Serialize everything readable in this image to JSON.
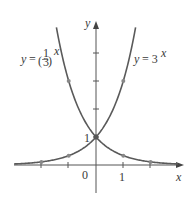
{
  "chart_data": {
    "type": "line",
    "title": "",
    "xlabel": "x",
    "ylabel": "y",
    "x_ticks": [
      "0",
      "1"
    ],
    "y_ticks": [
      "1"
    ],
    "xlim": [
      -3,
      2.9
    ],
    "ylim": [
      -0.5,
      5.4
    ],
    "grid": false,
    "series": [
      {
        "name": "y = 3^x",
        "label_text": "y = 3",
        "label_exp": "x",
        "points": [
          [
            -2,
            0.111
          ],
          [
            -1,
            0.333
          ],
          [
            0,
            1
          ],
          [
            1,
            3
          ]
        ]
      },
      {
        "name": "y = (1/3)^x",
        "label_text": "y =",
        "label_frac_num": "1",
        "label_frac_den": "3",
        "label_exp": "x",
        "points": [
          [
            -1,
            3
          ],
          [
            0,
            1
          ],
          [
            1,
            0.333
          ],
          [
            2,
            0.111
          ]
        ]
      }
    ],
    "colors": {
      "curve": "#555555",
      "axis": "#555555",
      "point": "#777777"
    }
  }
}
